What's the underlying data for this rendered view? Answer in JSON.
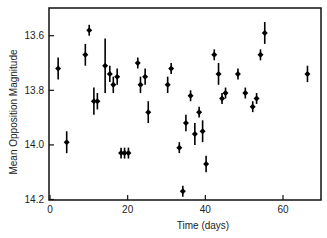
{
  "chart_data": {
    "type": "scatter",
    "title": "",
    "xlabel": "Time (days)",
    "ylabel": "Mean Opposition Magnitude",
    "xlim": [
      0,
      70
    ],
    "ylim": [
      14.2,
      13.5
    ],
    "y_inverted": true,
    "grid": false,
    "legend": null,
    "x_ticks": [
      0,
      20,
      40,
      60
    ],
    "x_tick_labels": [
      "0",
      "20",
      "40",
      "60"
    ],
    "y_ticks": [
      13.6,
      13.8,
      14.0,
      14.2
    ],
    "y_tick_labels": [
      "13.6",
      "13.8",
      "14.0",
      "14.2"
    ],
    "series": [
      {
        "name": "observations",
        "marker": "diamond",
        "color": "#000000",
        "points": [
          {
            "x": 2.1,
            "y": 13.72,
            "err": 0.04
          },
          {
            "x": 4.3,
            "y": 13.99,
            "err": 0.04
          },
          {
            "x": 9.1,
            "y": 13.67,
            "err": 0.04
          },
          {
            "x": 10.1,
            "y": 13.58,
            "err": 0.02
          },
          {
            "x": 11.3,
            "y": 13.84,
            "err": 0.05
          },
          {
            "x": 12.2,
            "y": 13.84,
            "err": 0.03
          },
          {
            "x": 14.2,
            "y": 13.71,
            "err": 0.1
          },
          {
            "x": 15.4,
            "y": 13.74,
            "err": 0.03
          },
          {
            "x": 16.3,
            "y": 13.78,
            "err": 0.03
          },
          {
            "x": 17.3,
            "y": 13.75,
            "err": 0.03
          },
          {
            "x": 18.3,
            "y": 14.03,
            "err": 0.02
          },
          {
            "x": 19.2,
            "y": 14.03,
            "err": 0.02
          },
          {
            "x": 20.2,
            "y": 14.03,
            "err": 0.02
          },
          {
            "x": 22.6,
            "y": 13.7,
            "err": 0.02
          },
          {
            "x": 23.3,
            "y": 13.78,
            "err": 0.03
          },
          {
            "x": 24.5,
            "y": 13.75,
            "err": 0.03
          },
          {
            "x": 25.3,
            "y": 13.88,
            "err": 0.04
          },
          {
            "x": 30.3,
            "y": 13.78,
            "err": 0.03
          },
          {
            "x": 31.2,
            "y": 13.72,
            "err": 0.02
          },
          {
            "x": 33.3,
            "y": 14.01,
            "err": 0.02
          },
          {
            "x": 34.2,
            "y": 14.17,
            "err": 0.02
          },
          {
            "x": 35.0,
            "y": 13.92,
            "err": 0.03
          },
          {
            "x": 36.2,
            "y": 13.82,
            "err": 0.02
          },
          {
            "x": 37.3,
            "y": 13.96,
            "err": 0.04
          },
          {
            "x": 38.4,
            "y": 13.88,
            "err": 0.02
          },
          {
            "x": 39.3,
            "y": 13.95,
            "err": 0.04
          },
          {
            "x": 40.2,
            "y": 14.07,
            "err": 0.03
          },
          {
            "x": 42.3,
            "y": 13.67,
            "err": 0.02
          },
          {
            "x": 43.4,
            "y": 13.74,
            "err": 0.04
          },
          {
            "x": 44.3,
            "y": 13.83,
            "err": 0.02
          },
          {
            "x": 45.2,
            "y": 13.81,
            "err": 0.02
          },
          {
            "x": 48.4,
            "y": 13.74,
            "err": 0.02
          },
          {
            "x": 50.3,
            "y": 13.81,
            "err": 0.02
          },
          {
            "x": 52.2,
            "y": 13.86,
            "err": 0.02
          },
          {
            "x": 53.2,
            "y": 13.83,
            "err": 0.02
          },
          {
            "x": 54.2,
            "y": 13.67,
            "err": 0.02
          },
          {
            "x": 55.3,
            "y": 13.59,
            "err": 0.04
          },
          {
            "x": 66.3,
            "y": 13.74,
            "err": 0.03
          }
        ]
      }
    ]
  },
  "layout": {
    "plot": {
      "left": 49,
      "top": 8,
      "right": 321,
      "bottom": 200
    },
    "x_px": {
      "v0": 0,
      "p0": 50,
      "v1": 60,
      "p1": 283
    },
    "y_px": {
      "v0": 13.6,
      "p0": 35.7,
      "v1": 14.2,
      "p1": 199.5
    }
  }
}
